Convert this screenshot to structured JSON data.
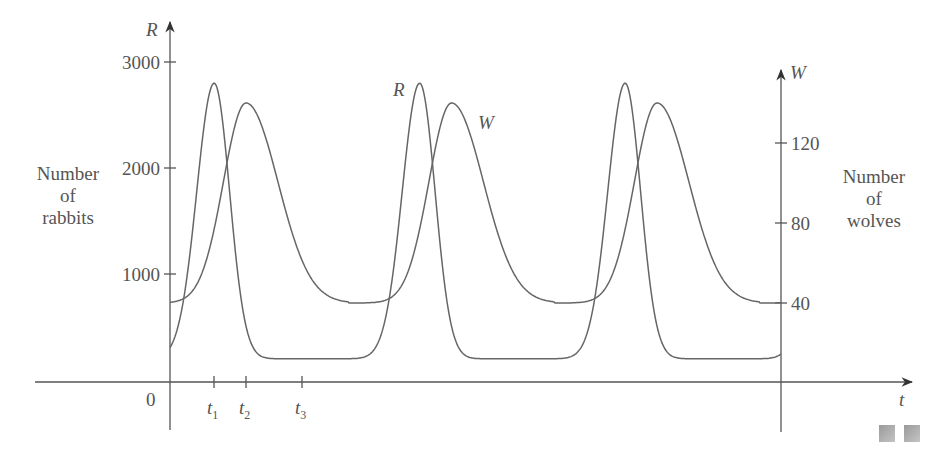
{
  "chart_data": {
    "type": "line",
    "title": "",
    "x": [
      0,
      0.25,
      0.5,
      0.75,
      1.0,
      1.25,
      1.5,
      1.75,
      2.0,
      2.25,
      2.5,
      2.75,
      3.0
    ],
    "series": [
      {
        "name": "R",
        "axis": "left",
        "label": "R",
        "peaks_t": [
          0.21,
          1.21,
          2.22
        ],
        "values_at_x": [
          1000,
          2600,
          1200,
          250,
          200,
          2500,
          1300,
          260,
          220,
          2550,
          1300,
          260,
          1000
        ]
      },
      {
        "name": "W",
        "axis": "right",
        "label": "W",
        "peaks_t": [
          0.37,
          1.36,
          2.35
        ],
        "values_at_x": [
          40,
          110,
          135,
          80,
          45,
          90,
          138,
          85,
          45,
          90,
          138,
          82,
          40
        ]
      }
    ],
    "left_axis": {
      "label": "R",
      "title": [
        "Number",
        "of",
        "rabbits"
      ],
      "ticks": [
        1000,
        2000,
        3000
      ],
      "range": [
        0,
        3300
      ]
    },
    "right_axis": {
      "label": "W",
      "title": [
        "Number",
        "of",
        "wolves"
      ],
      "ticks": [
        40,
        80,
        120
      ],
      "range": [
        0,
        156
      ]
    },
    "x_axis": {
      "label": "t",
      "origin_label": "0",
      "tick_labels": [
        "t1",
        "t2",
        "t3"
      ]
    },
    "grid": false,
    "legend": "inline curve labels"
  },
  "labels": {
    "left_axis_letter": "R",
    "right_axis_letter": "W",
    "x_axis_letter": "t",
    "origin": "0",
    "left_ticks": [
      "3000",
      "2000",
      "1000"
    ],
    "right_ticks": [
      "120",
      "80",
      "40"
    ],
    "left_title": [
      "Number",
      "of",
      "rabbits"
    ],
    "right_title": [
      "Number",
      "of",
      "wolves"
    ],
    "curve_R": "R",
    "curve_W": "W",
    "t_ticks": [
      {
        "main": "t",
        "sub": "1"
      },
      {
        "main": "t",
        "sub": "2"
      },
      {
        "main": "t",
        "sub": "3"
      }
    ]
  }
}
